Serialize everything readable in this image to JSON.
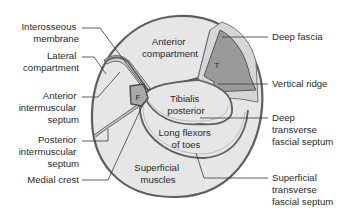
{
  "diagram": {
    "colors": {
      "background": "#ffffff",
      "tissue_fill": "#e6e6e6",
      "tibia_fill": "#9a9a9a",
      "fibula_fill": "#a8a8a8",
      "septum_fill": "#d0d0d0",
      "outline": "#5e5e5e",
      "text": "#2a2a2a"
    },
    "regions": {
      "anterior": [
        "Anterior",
        "compartment"
      ],
      "tibialis": [
        "Tibialis",
        "posterior"
      ],
      "flexors": [
        "Long flexors",
        "of toes"
      ],
      "superficial": [
        "Superficial",
        "muscles"
      ],
      "tibia": "T",
      "fibula": "F"
    },
    "labels_left": {
      "interosseous": [
        "Interosseous",
        "membrane"
      ],
      "lateral": [
        "Lateral",
        "compartment"
      ],
      "anterior_septum": [
        "Anterior",
        "intermuscular",
        "septum"
      ],
      "posterior_septum": [
        "Posterior",
        "intermuscular",
        "septum"
      ],
      "medial_crest": [
        "Medial crest"
      ]
    },
    "labels_right": {
      "deep_fascia": [
        "Deep fascia"
      ],
      "vertical_ridge": [
        "Vertical ridge"
      ],
      "deep_transverse": [
        "Deep",
        "transverse",
        "fascial septum"
      ],
      "superficial_transverse": [
        "Superficial",
        "transverse",
        "fascial septum"
      ]
    }
  }
}
